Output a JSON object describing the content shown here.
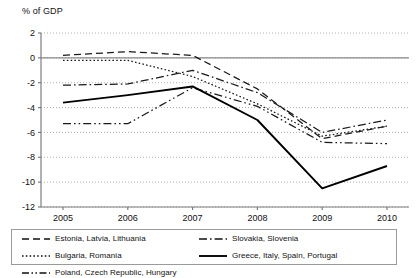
{
  "chart_data": {
    "type": "line",
    "title": "",
    "subtitle": "",
    "xlabel": "",
    "ylabel": "% of GDP",
    "axis_title": "% of GDP",
    "categories": [
      "2005",
      "2006",
      "2007",
      "2008",
      "2009",
      "2010"
    ],
    "x": [
      2005,
      2006,
      2007,
      2008,
      2009,
      2010
    ],
    "xlim": [
      2004.6,
      2010.4
    ],
    "ylim": [
      -12,
      2
    ],
    "yticks": [
      2,
      0,
      -2,
      -4,
      -6,
      -8,
      -10,
      -12
    ],
    "ytick_labels": [
      "2",
      "0",
      "-2",
      "-4",
      "-6",
      "-8",
      "-10",
      "-12"
    ],
    "grid": true,
    "grid_style": "dotted-horizontal",
    "zero_line": true,
    "legend_position": "bottom",
    "series": [
      {
        "name": "Estonia, Latvia, Lithuania",
        "style": "dashed",
        "color": "#1a1a1a",
        "values": [
          0.2,
          0.5,
          0.2,
          -2.5,
          -6.5,
          -5.5
        ]
      },
      {
        "name": "Slovakia, Slovenia",
        "style": "dash-dot",
        "color": "#1a1a1a",
        "values": [
          -2.2,
          -2.1,
          -1.0,
          -2.8,
          -6.0,
          -5.0
        ]
      },
      {
        "name": "Bulgaria, Romania",
        "style": "dotted",
        "color": "#1a1a1a",
        "values": [
          -0.2,
          -0.2,
          -1.5,
          -3.7,
          -6.3,
          -5.5
        ]
      },
      {
        "name": "Poland, Czech Republic, Hungary",
        "style": "dash-dot-dot",
        "color": "#1a1a1a",
        "values": [
          -5.3,
          -5.3,
          -2.4,
          -3.9,
          -6.8,
          -6.9
        ]
      },
      {
        "name": "Greece, Italy, Spain, Portugal",
        "style": "solid",
        "color": "#000000",
        "values": [
          -3.6,
          -3.0,
          -2.3,
          -5.0,
          -10.5,
          -8.7
        ]
      }
    ]
  },
  "legend": {
    "rows": [
      [
        {
          "label": "Estonia, Latvia, Lithuania",
          "style": "dashed"
        },
        {
          "label": "Slovakia, Slovenia",
          "style": "dash-dot"
        }
      ],
      [
        {
          "label": "Bulgaria, Romania",
          "style": "dotted"
        },
        {
          "label": "Greece, Italy, Spain, Portugal",
          "style": "solid"
        }
      ],
      [
        {
          "label": "Poland, Czech Republic, Hungary",
          "style": "dash-dot-dot"
        }
      ]
    ]
  }
}
